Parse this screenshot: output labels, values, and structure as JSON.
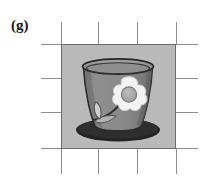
{
  "figure": {
    "label": "(g)",
    "kind": "grayscale-photograph-panel",
    "panel": {
      "x": 61,
      "y": 44,
      "width": 115,
      "height": 105,
      "background_color": "#b9b9b9",
      "border_color": "#6e6e6e"
    },
    "grid": {
      "line_color": "#8e8e8e",
      "vertical_x": [
        61,
        98,
        137,
        176
      ],
      "horizontal_y": [
        44,
        78,
        112,
        148
      ],
      "tick_length_outer": 22,
      "description": "registration crop marks extending outside the image panel"
    },
    "objects": [
      {
        "name": "saucer-shadow",
        "shape": "ellipse",
        "color": "#262626",
        "cx": 57,
        "cy": 86,
        "rx": 42,
        "ry": 11
      },
      {
        "name": "pot-body",
        "shape": "tapered-cup",
        "fill_color": "#8c8c8c",
        "shade_color": "#6f6f6f",
        "outline_color": "#2b2b2b"
      },
      {
        "name": "pot-rim",
        "shape": "ellipse",
        "fill_color": "#9a9a9a",
        "outline_color": "#2b2b2b",
        "cx": 57,
        "cy": 22,
        "rx": 35,
        "ry": 7
      },
      {
        "name": "flower-petals",
        "shape": "five-petal-blossom",
        "fill_color": "#f4f4f4",
        "outline_color": "#cfcfcf",
        "cx": 66,
        "cy": 48
      },
      {
        "name": "flower-center",
        "shape": "circle",
        "fill_color": "#a6a6a6",
        "outline_color": "#7c7c7c",
        "cx": 66,
        "cy": 48,
        "r": 7
      },
      {
        "name": "flower-stem",
        "shape": "curved-line",
        "color": "#2e2e2e"
      },
      {
        "name": "leaf-upper",
        "shape": "leaf",
        "fill_color": "#cfcfcf",
        "outline_color": "#5a5a5a"
      },
      {
        "name": "leaf-lower",
        "shape": "leaf",
        "fill_color": "#b5b5b5",
        "outline_color": "#5a5a5a"
      }
    ]
  }
}
